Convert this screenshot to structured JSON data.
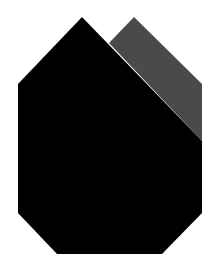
{
  "figure": {
    "width": 218,
    "height": 270,
    "background": "#ffffff",
    "shapes": [
      {
        "name": "gray-peak-shape",
        "fill": "#4a4a4a",
        "points": "109,43 134,17 202,84 202,141"
      },
      {
        "name": "black-house-shape",
        "fill": "#000000",
        "points": "82,17 202,141 202,213 162,254 57,254 18,213 18,84"
      }
    ]
  }
}
